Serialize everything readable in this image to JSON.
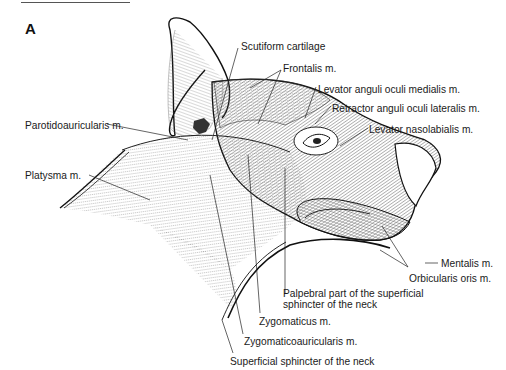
{
  "figure": {
    "panel_letter": "A",
    "labels": [
      {
        "id": "scutiform",
        "text": "Scutiform cartilage"
      },
      {
        "id": "frontalis",
        "text": "Frontalis m."
      },
      {
        "id": "levator-anguli",
        "text": "Levator anguli oculi medialis m."
      },
      {
        "id": "retractor-anguli",
        "text": "Retractor anguli oculi lateralis m."
      },
      {
        "id": "parotidoauricularis",
        "text": "Parotidoauricularis m."
      },
      {
        "id": "levator-nasolabialis",
        "text": "Levator nasolabialis m."
      },
      {
        "id": "platysma",
        "text": "Platysma m."
      },
      {
        "id": "mentalis",
        "text": "Mentalis m."
      },
      {
        "id": "orbicularis-oris",
        "text": "Orbicularis oris m."
      },
      {
        "id": "palpebral-line1",
        "text": "Palpebral part of the superficial"
      },
      {
        "id": "palpebral-line2",
        "text": "sphincter of the neck"
      },
      {
        "id": "zygomaticus",
        "text": "Zygomaticus m."
      },
      {
        "id": "zygomaticoauricularis",
        "text": "Zygomaticoauricularis m."
      },
      {
        "id": "superficial-sphincter",
        "text": "Superficial sphincter of the neck"
      }
    ]
  }
}
